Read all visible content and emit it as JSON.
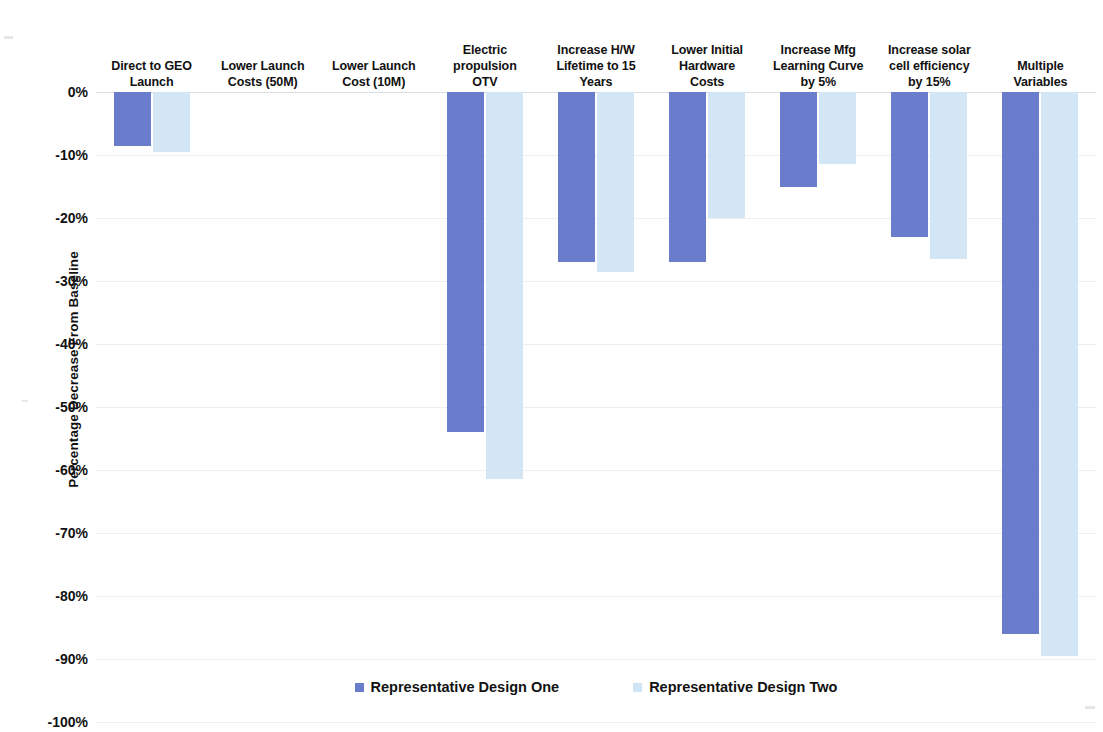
{
  "chart_data": {
    "type": "bar",
    "title": "",
    "xlabel": "",
    "ylabel": "Percentage Decrease From Baseline",
    "ylim": [
      -100,
      0
    ],
    "ytick_step": 10,
    "grid": true,
    "legend_position": "bottom",
    "categories": [
      "Direct to GEO Launch",
      "Lower Launch Costs (50M)",
      "Lower Launch Cost (10M)",
      "Electric propulsion OTV",
      "Increase H/W Lifetime to 15 Years",
      "Lower Initial Hardware Costs",
      "Increase Mfg Learning Curve by 5%",
      "Increase solar cell efficiency by 15%",
      "Multiple Variables"
    ],
    "categories_wrapped": [
      [
        "Direct to GEO",
        "Launch"
      ],
      [
        "Lower Launch",
        "Costs (50M)"
      ],
      [
        "Lower Launch",
        "Cost (10M)"
      ],
      [
        "Electric",
        "propulsion",
        "OTV"
      ],
      [
        "Increase H/W",
        "Lifetime to 15",
        "Years"
      ],
      [
        "Lower Initial",
        "Hardware",
        "Costs"
      ],
      [
        "Increase Mfg",
        "Learning Curve",
        "by 5%"
      ],
      [
        "Increase solar",
        "cell efficiency",
        "by 15%"
      ],
      [
        "Multiple",
        "Variables"
      ]
    ],
    "ytick_labels": [
      "0%",
      "-10%",
      "-20%",
      "-30%",
      "-40%",
      "-50%",
      "-60%",
      "-70%",
      "-80%",
      "-90%",
      "-100%"
    ],
    "ytick_values": [
      0,
      -10,
      -20,
      -30,
      -40,
      -50,
      -60,
      -70,
      -80,
      -90,
      -100
    ],
    "series": [
      {
        "name": "Representative Design One",
        "color": "#6a7ccc",
        "values": [
          -8.5,
          0,
          0,
          -54,
          -27,
          -27,
          -15,
          -23,
          -86
        ]
      },
      {
        "name": "Representative Design Two",
        "color": "#d3e6f6",
        "values": [
          -9.5,
          0,
          0,
          -61.5,
          -28.5,
          -20,
          -11.5,
          -26.5,
          -89.5
        ]
      }
    ]
  }
}
